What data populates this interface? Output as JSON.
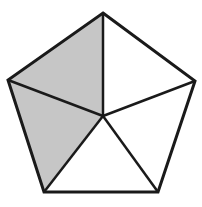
{
  "diagram": {
    "colors": {
      "background": "#ffffff",
      "stroke": "#1a1a1a",
      "shade": "#c6c6c6",
      "unshaded": "#ffffff"
    },
    "stroke_width": 3,
    "center": [
      103,
      116
    ],
    "vertices": [
      [
        103,
        13
      ],
      [
        195,
        81
      ],
      [
        158,
        192
      ],
      [
        44,
        192
      ],
      [
        8,
        80
      ]
    ],
    "triangles": [
      {
        "id": "top-left",
        "shaded": true
      },
      {
        "id": "top-right",
        "shaded": false
      },
      {
        "id": "right",
        "shaded": false
      },
      {
        "id": "bottom",
        "shaded": false
      },
      {
        "id": "left",
        "shaded": true
      }
    ]
  }
}
